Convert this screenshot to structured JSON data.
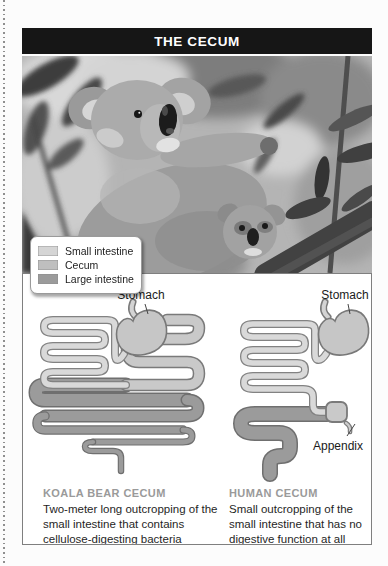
{
  "title": "THE CECUM",
  "photo": {
    "description": "Adult koala with joey among eucalyptus branches and leaves"
  },
  "legend": {
    "items": [
      {
        "label": "Small intestine",
        "color": "#d5d5d5"
      },
      {
        "label": "Cecum",
        "color": "#bfbfbf"
      },
      {
        "label": "Large intestine",
        "color": "#9b9b9b"
      }
    ]
  },
  "koala_diagram": {
    "stomach_label": "Stomach",
    "caption_title": "KOALA BEAR CECUM",
    "caption_body": "Two-meter long outcropping of the small intestine that contains cellulose-digesting bacteria"
  },
  "human_diagram": {
    "stomach_label": "Stomach",
    "appendix_label": "Appendix",
    "caption_title": "HUMAN CECUM",
    "caption_body": "Small outcropping of the small intestine that has no digestive function at all"
  },
  "colors": {
    "small_intestine_fill": "#d9d9d9",
    "cecum_fill": "#c9c9c9",
    "large_intestine_fill": "#9b9b9b",
    "tube_outline": "#7a7a7a",
    "stomach_fill": "#c6c6c6",
    "title_bar_bg": "#161616"
  }
}
